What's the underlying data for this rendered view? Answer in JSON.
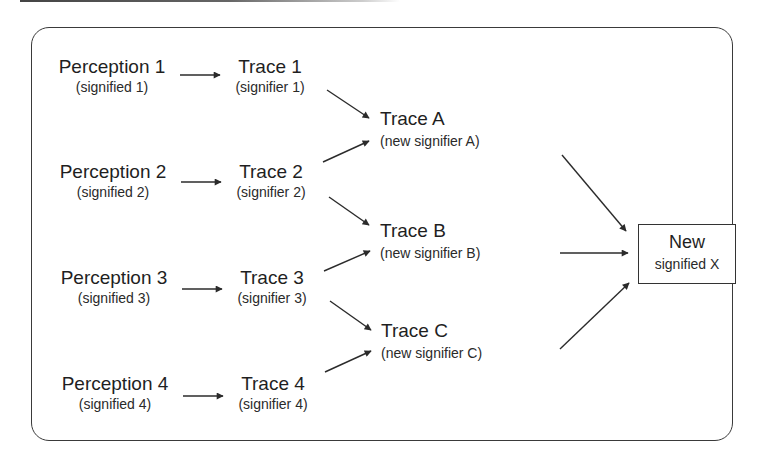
{
  "diagram": {
    "perceptions": [
      {
        "title": "Perception 1",
        "sub": "(signified 1)"
      },
      {
        "title": "Perception 2",
        "sub": "(signified 2)"
      },
      {
        "title": "Perception 3",
        "sub": "(signified 3)"
      },
      {
        "title": "Perception 4",
        "sub": "(signified 4)"
      }
    ],
    "traces": [
      {
        "title": "Trace 1",
        "sub": "(signifier 1)"
      },
      {
        "title": "Trace 2",
        "sub": "(signifier 2)"
      },
      {
        "title": "Trace 3",
        "sub": "(signifier 3)"
      },
      {
        "title": "Trace 4",
        "sub": "(signifier 4)"
      }
    ],
    "new_traces": [
      {
        "title": "Trace A",
        "sub": "(new signifier A)"
      },
      {
        "title": "Trace B",
        "sub": "(new signifier B)"
      },
      {
        "title": "Trace C",
        "sub": "(new signifier C)"
      }
    ],
    "result": {
      "title": "New",
      "sub": "signified X"
    },
    "edges": [
      [
        "Perception 1",
        "Trace 1"
      ],
      [
        "Perception 2",
        "Trace 2"
      ],
      [
        "Perception 3",
        "Trace 3"
      ],
      [
        "Perception 4",
        "Trace 4"
      ],
      [
        "Trace 1",
        "Trace A"
      ],
      [
        "Trace 2",
        "Trace A"
      ],
      [
        "Trace 2",
        "Trace B"
      ],
      [
        "Trace 3",
        "Trace B"
      ],
      [
        "Trace 3",
        "Trace C"
      ],
      [
        "Trace 4",
        "Trace C"
      ],
      [
        "Trace A",
        "New signified X"
      ],
      [
        "Trace B",
        "New signified X"
      ],
      [
        "Trace C",
        "New signified X"
      ]
    ],
    "colors": {
      "stroke": "#2b2b2b",
      "text": "#1f1f1f",
      "background": "#ffffff"
    }
  }
}
